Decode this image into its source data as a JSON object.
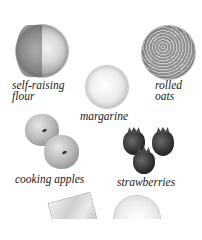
{
  "ingredients": [
    {
      "id": "self-raising-flour",
      "label": "self-raising\nflour"
    },
    {
      "id": "rolled-oats",
      "label": "rolled\noats"
    },
    {
      "id": "margarine",
      "label": "margarine"
    },
    {
      "id": "cooking-apples",
      "label": "cooking apples"
    },
    {
      "id": "strawberries",
      "label": "strawberries"
    }
  ],
  "partial_items": [
    {
      "id": "bag-item",
      "label": ""
    },
    {
      "id": "bowl-item",
      "label": ""
    }
  ]
}
